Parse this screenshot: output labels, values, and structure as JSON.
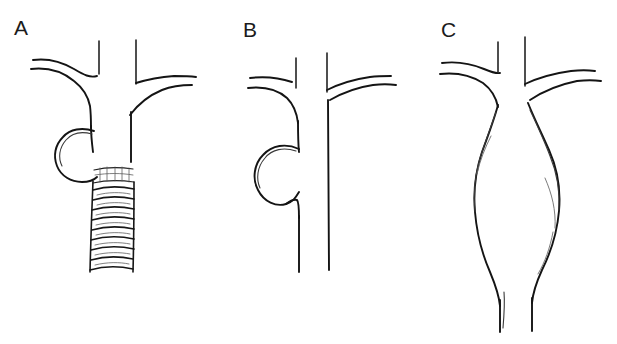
{
  "figure": {
    "width": 617,
    "height": 344,
    "background_color": "#ffffff",
    "ink_color": "#141414",
    "style": "hand-drawn line art, pen sketch, no shading"
  },
  "panels": [
    {
      "id": "a",
      "label": "A",
      "description": "Saccular aneurysm of the descending aorta with an endovascular stent graft deployed in the aortic lumen",
      "features": [
        "aortic arch with two branch vessels",
        "saccular aneurysm sac on the left wall",
        "covered stent graft with proximal sealing collar",
        "corrugated stent rings"
      ],
      "stent_ring_count": 9
    },
    {
      "id": "b",
      "label": "B",
      "description": "Saccular aneurysm of the aorta before repair, outpouching from the left aortic wall",
      "features": [
        "aortic arch with two branch vessels",
        "rounded saccular outpouching on the left",
        "normal caliber distal aorta"
      ],
      "stent_ring_count": 0
    },
    {
      "id": "c",
      "label": "C",
      "description": "Fusiform aneurysm with symmetric spindle-shaped dilatation of the aortic segment",
      "features": [
        "aortic arch with two branch vessels",
        "symmetric fusiform dilatation",
        "tapering return to normal caliber distally"
      ],
      "stent_ring_count": 0
    }
  ],
  "labels": {
    "a": "A",
    "b": "B",
    "c": "C"
  }
}
